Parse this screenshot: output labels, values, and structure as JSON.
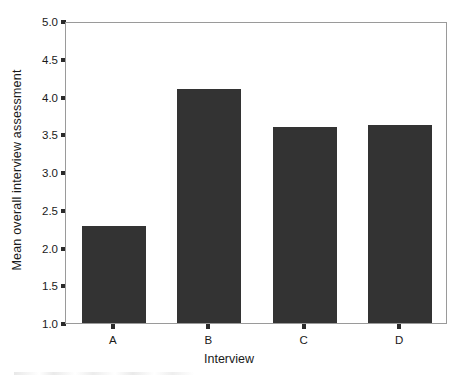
{
  "chart_data": {
    "type": "bar",
    "title": "",
    "subtitle": "",
    "xlabel": "Interview",
    "ylabel": "Mean overall interview assessment",
    "categories": [
      "A",
      "B",
      "C",
      "D"
    ],
    "values": [
      2.29,
      4.1,
      3.6,
      3.62
    ],
    "series": [
      {
        "name": "Mean overall interview assessment",
        "values": [
          2.29,
          4.1,
          3.6,
          3.62
        ]
      }
    ],
    "ylim": [
      1.0,
      5.0
    ],
    "ytick_labels": [
      "5.0",
      "4.5",
      "4.0",
      "3.5",
      "3.0",
      "2.5",
      "2.0",
      "1.5",
      "1.0"
    ],
    "ytick_values": [
      5.0,
      4.5,
      4.0,
      3.5,
      3.0,
      2.5,
      2.0,
      1.5,
      1.0
    ],
    "xtick_labels": [
      "A",
      "B",
      "C",
      "D"
    ],
    "grid": false,
    "legend": false,
    "legend_position": "none",
    "bar_color": "#333333",
    "axis_color": "#9a9a9a",
    "background_color": "#ffffff",
    "annotations": []
  }
}
